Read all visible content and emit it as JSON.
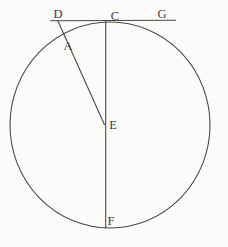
{
  "figure": {
    "width": 228,
    "height": 247,
    "background_color": "#fbfbfa",
    "stroke_color": "#4a4a48",
    "label_color": "#3a3a38",
    "stroke_width": 1.1,
    "label_font_size": 12.5,
    "circle": {
      "name": "circle",
      "cx": 110,
      "cy": 125,
      "rx": 100,
      "ry": 103
    },
    "lines": [
      {
        "name": "tangent-line-DG",
        "x1": 50,
        "y1": 20.8,
        "x2": 176,
        "y2": 20.3
      },
      {
        "name": "diameter-CF",
        "x1": 105.7,
        "y1": 21,
        "x2": 105.7,
        "y2": 228.5
      },
      {
        "name": "segment-DAE",
        "x1": 57.5,
        "y1": 20,
        "x2": 104.6,
        "y2": 125
      }
    ],
    "labels": [
      {
        "text": "D",
        "x": 58,
        "y": 18
      },
      {
        "text": "C",
        "x": 115,
        "y": 20
      },
      {
        "text": "G",
        "x": 162,
        "y": 18
      },
      {
        "text": "A",
        "x": 68,
        "y": 49.5
      },
      {
        "text": "E",
        "x": 113,
        "y": 128.5
      },
      {
        "text": "F",
        "x": 111,
        "y": 224.5
      }
    ]
  }
}
